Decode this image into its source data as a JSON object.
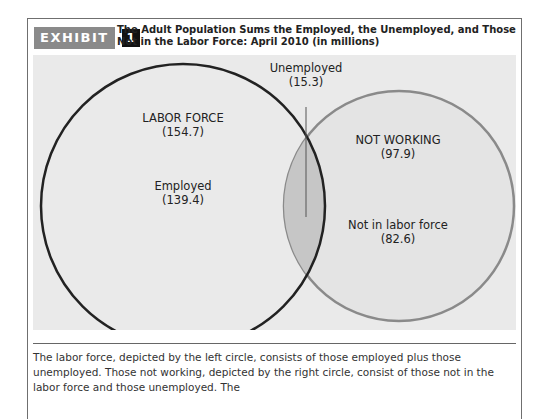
{
  "header": {
    "exhibit_label": "EXHIBIT",
    "exhibit_number": "1",
    "title": "The Adult Population Sums the Employed, the Unemployed, and Those Not in the Labor Force: April 2010 (in millions)"
  },
  "diagram": {
    "labor_force": {
      "label": "LABOR FORCE",
      "value": "(154.7)"
    },
    "employed": {
      "label": "Employed",
      "value": "(139.4)"
    },
    "unemployed": {
      "label": "Unemployed",
      "value": "(15.3)"
    },
    "not_working": {
      "label": "NOT WORKING",
      "value": "(97.9)"
    },
    "not_in_labor_force": {
      "label": "Not in labor force",
      "value": "(82.6)"
    },
    "colors": {
      "panel_bg": "#eaeaea",
      "left_circle_stroke": "#222222",
      "right_circle_stroke": "#8a8a8a",
      "right_circle_fill": "#e4e4e4",
      "overlap_fill": "#c8c8c8"
    }
  },
  "caption": "The labor force, depicted by the left circle, consists of those employed plus those unemployed. Those not working, depicted by the right circle, consist of those not in the labor force and those unemployed. The"
}
